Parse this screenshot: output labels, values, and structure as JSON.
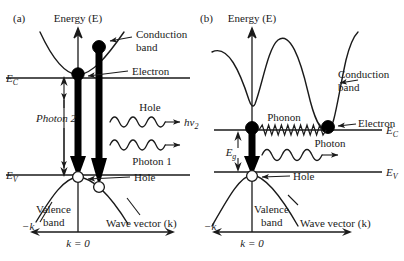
{
  "figure": {
    "type": "diagram",
    "panels": [
      {
        "id": "a",
        "panel_label": "(a)",
        "bandgap_type": "direct",
        "axis": {
          "y_label": "Energy (E)",
          "x_label": "Wave vector (k)",
          "x_origin_label": "k = 0",
          "x_negative_label": "−k"
        },
        "levels": [
          {
            "name": "conduction-band-edge",
            "label": "E",
            "sublabel": "C",
            "side": "left"
          },
          {
            "name": "valence-band-edge",
            "label": "E",
            "sublabel": "V",
            "side": "left"
          }
        ],
        "annotations": [
          {
            "name": "conduction-band-label",
            "text_line1": "Conduction",
            "text_line2": "band"
          },
          {
            "name": "valence-band-label",
            "text_line1": "Valence",
            "text_line2": "band"
          },
          {
            "name": "electron-label",
            "text": "Electron"
          },
          {
            "name": "hole-label",
            "text": "Hole"
          },
          {
            "name": "photon1-label",
            "text": "Photon 1"
          },
          {
            "name": "photon2-label",
            "text": "Photon 2"
          },
          {
            "name": "bandgap-label",
            "text": "E",
            "sublabel": "g"
          },
          {
            "name": "photon1-energy-label",
            "text": "hν",
            "sublabel": "1"
          },
          {
            "name": "photon2-energy-label",
            "text": "hν",
            "sublabel": "2"
          }
        ],
        "particles": [
          {
            "name": "electron-dot-1",
            "kind": "electron"
          },
          {
            "name": "electron-dot-2",
            "kind": "electron"
          },
          {
            "name": "hole-circle-1",
            "kind": "hole"
          },
          {
            "name": "hole-circle-2",
            "kind": "hole"
          }
        ]
      },
      {
        "id": "b",
        "panel_label": "(b)",
        "bandgap_type": "indirect",
        "axis": {
          "y_label": "Energy (E)",
          "x_label": "Wave vector (k)",
          "x_origin_label": "k = 0",
          "x_negative_label": "−k"
        },
        "levels": [
          {
            "name": "conduction-band-edge",
            "label": "E",
            "sublabel": "C",
            "side": "right"
          },
          {
            "name": "valence-band-edge",
            "label": "E",
            "sublabel": "V",
            "side": "right"
          }
        ],
        "annotations": [
          {
            "name": "conduction-band-label",
            "text_line1": "Conduction",
            "text_line2": "band"
          },
          {
            "name": "valence-band-label",
            "text_line1": "Valence",
            "text_line2": "band"
          },
          {
            "name": "electron-label",
            "text": "Electron"
          },
          {
            "name": "hole-label",
            "text": "Hole"
          },
          {
            "name": "phonon-label",
            "text": "Phonon"
          },
          {
            "name": "photon-label",
            "text": "Photon"
          },
          {
            "name": "bandgap-label",
            "text": "E",
            "sublabel": "g"
          }
        ],
        "particles": [
          {
            "name": "electron-dot-1",
            "kind": "electron"
          },
          {
            "name": "electron-dot-2",
            "kind": "electron"
          },
          {
            "name": "hole-circle-1",
            "kind": "hole"
          }
        ]
      }
    ],
    "colors": {
      "ink": "#1a1a1a",
      "fill_electron": "#000000",
      "fill_hole": "#ffffff",
      "background": "#ffffff"
    }
  }
}
